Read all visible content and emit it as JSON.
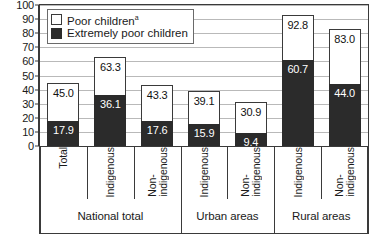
{
  "chart_data": {
    "type": "bar",
    "title": "",
    "subtitle": "",
    "xlabel": "",
    "ylabel": "",
    "ylim": [
      0,
      100
    ],
    "yticks": [
      0,
      10,
      20,
      30,
      40,
      50,
      60,
      70,
      80,
      90,
      100
    ],
    "grid": true,
    "legend_position": "top-left",
    "stacked_note": "Extremely poor children segment is drawn inside the poor children bar (overlapping, not additive)",
    "categories": [
      "Total",
      "Indigenous",
      "Non-indigenous",
      "Indigenous",
      "Non-indigenous",
      "Indigenous",
      "Non-indigenous"
    ],
    "category_lines": [
      [
        "Total"
      ],
      [
        "Indigenous"
      ],
      [
        "Non-",
        "indigenous"
      ],
      [
        "Indigenous"
      ],
      [
        "Non-",
        "indigenous"
      ],
      [
        "Indigenous"
      ],
      [
        "Non-",
        "indigenous"
      ]
    ],
    "groups": [
      {
        "label": "National total",
        "span": 3
      },
      {
        "label": "Urban areas",
        "span": 2
      },
      {
        "label": "Rural areas",
        "span": 2
      }
    ],
    "series": [
      {
        "name": "Poor children",
        "name_superscript": "a",
        "color": "#ffffff",
        "values": [
          45.0,
          63.3,
          43.3,
          39.1,
          30.9,
          92.8,
          83.0
        ],
        "value_labels": [
          "45.0",
          "63.3",
          "43.3",
          "39.1",
          "30.9",
          "92.8",
          "83.0"
        ]
      },
      {
        "name": "Extremely poor children",
        "color": "#2b2b2b",
        "values": [
          17.9,
          36.1,
          17.6,
          15.9,
          9.4,
          60.7,
          44.0
        ],
        "value_labels": [
          "17.9",
          "36.1",
          "17.6",
          "15.9",
          "9.4",
          "60.7",
          "44.0"
        ]
      }
    ]
  },
  "legend": {
    "items": [
      {
        "label": "Poor children",
        "superscript": "a",
        "swatch": "poor"
      },
      {
        "label": "Extremely poor children",
        "superscript": "",
        "swatch": "extreme"
      }
    ]
  },
  "colors": {
    "poor_fill": "#ffffff",
    "extreme_fill": "#2b2b2b",
    "axis": "#3a3a3a",
    "grid": "#b9b9b9",
    "background": "#ffffff"
  }
}
